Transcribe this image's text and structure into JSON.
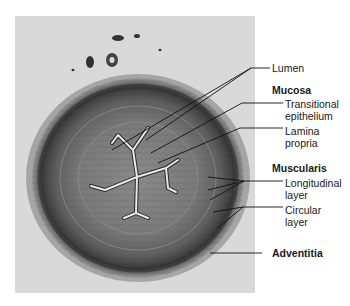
{
  "figure": {
    "colors": {
      "panel_bg": "#d9d9d9",
      "tissue_dark": "#3a3a3a",
      "tissue_mid": "#7a7a7a",
      "lumen": "#e6e6e6",
      "line": "#111111"
    }
  },
  "labels": {
    "lumen": "Lumen",
    "mucosa": "Mucosa",
    "transitional_1": "Transitional",
    "transitional_2": "epithelium",
    "lamina_1": "Lamina",
    "lamina_2": "propria",
    "muscularis": "Muscularis",
    "longitudinal_1": "Longitudinal",
    "longitudinal_2": "layer",
    "circular_1": "Circular",
    "circular_2": "layer",
    "adventitia": "Adventitia"
  }
}
